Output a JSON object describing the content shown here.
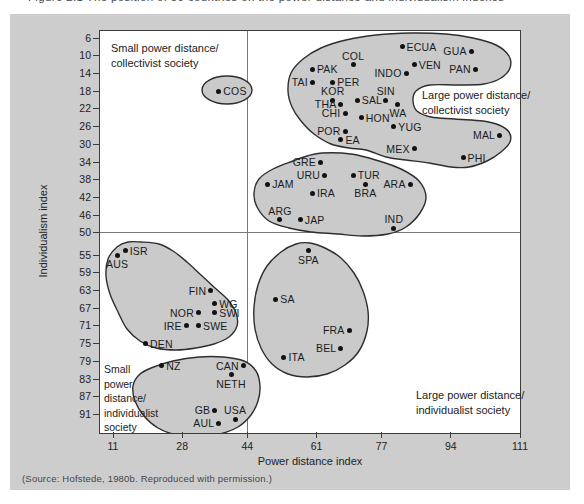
{
  "caption_clipped": "Figure 2.1  The position of 50 countries on the power distance and individualism indexes",
  "source_note": "(Source: Hofstede, 1980b. Reproduced with permission.)",
  "chart_data": {
    "type": "scatter",
    "xlabel": "Power distance index",
    "ylabel": "Individualism index",
    "x_ticks": [
      11,
      28,
      44,
      61,
      77,
      94,
      111
    ],
    "y_ticks": [
      6,
      10,
      14,
      18,
      22,
      26,
      30,
      34,
      38,
      42,
      46,
      50,
      55,
      59,
      63,
      67,
      71,
      75,
      79,
      83,
      87,
      91
    ],
    "x_range": [
      11,
      111
    ],
    "y_range": [
      6,
      91
    ],
    "y_inverted": true,
    "grid": false,
    "quadrant_divider": {
      "x": 44,
      "y": 50
    },
    "quadrant_labels": [
      {
        "id": "small-pd-collectivist",
        "lines": [
          "Small power distance/",
          "collectivist society"
        ],
        "x": 11,
        "y": 10,
        "size": "normal"
      },
      {
        "id": "large-pd-collectivist",
        "lines": [
          "Large power distance/",
          "collectivist society"
        ],
        "x": 322,
        "y": 57,
        "size": "normal"
      },
      {
        "id": "small-pd-individualist",
        "lines": [
          "Small",
          "power",
          "distance/",
          "individualist",
          "society"
        ],
        "x": 4,
        "y": 331,
        "size": "small"
      },
      {
        "id": "large-pd-individualist",
        "lines": [
          "Large power distance/",
          "individualist society"
        ],
        "x": 316,
        "y": 357,
        "size": "normal"
      }
    ],
    "points": [
      {
        "label": "PAK",
        "pdi": 60,
        "idv": 13,
        "lp": "right"
      },
      {
        "label": "COL",
        "pdi": 70,
        "idv": 12,
        "lp": "above"
      },
      {
        "label": "ECUA",
        "pdi": 82,
        "idv": 8,
        "lp": "right"
      },
      {
        "label": "GUA",
        "pdi": 99,
        "idv": 9,
        "lp": "left"
      },
      {
        "label": "VEN",
        "pdi": 85,
        "idv": 12,
        "lp": "right"
      },
      {
        "label": "PAN",
        "pdi": 100,
        "idv": 13,
        "lp": "left"
      },
      {
        "label": "INDO",
        "pdi": 83,
        "idv": 14,
        "lp": "left"
      },
      {
        "label": "TAI",
        "pdi": 60,
        "idv": 16,
        "lp": "left"
      },
      {
        "label": "PER",
        "pdi": 65,
        "idv": 16,
        "lp": "right"
      },
      {
        "label": "KOR",
        "pdi": 65,
        "idv": 20,
        "lp": "above"
      },
      {
        "label": "SIN",
        "pdi": 78,
        "idv": 20,
        "lp": "above"
      },
      {
        "label": "SAL",
        "pdi": 71,
        "idv": 20,
        "lp": "right"
      },
      {
        "label": "THA",
        "pdi": 67,
        "idv": 21,
        "lp": "left"
      },
      {
        "label": "WA",
        "pdi": 81,
        "idv": 21,
        "lp": "below"
      },
      {
        "label": "CHI",
        "pdi": 68,
        "idv": 23,
        "lp": "left"
      },
      {
        "label": "HON",
        "pdi": 72,
        "idv": 24,
        "lp": "right"
      },
      {
        "label": "POR",
        "pdi": 68,
        "idv": 27,
        "lp": "left"
      },
      {
        "label": "YUG",
        "pdi": 80,
        "idv": 26,
        "lp": "right"
      },
      {
        "label": "EA",
        "pdi": 67,
        "idv": 29,
        "lp": "right"
      },
      {
        "label": "MEX",
        "pdi": 85,
        "idv": 31,
        "lp": "left"
      },
      {
        "label": "MAL",
        "pdi": 106,
        "idv": 28,
        "lp": "left"
      },
      {
        "label": "PHI",
        "pdi": 97,
        "idv": 33,
        "lp": "right"
      },
      {
        "label": "COS",
        "pdi": 37,
        "idv": 18,
        "lp": "right"
      },
      {
        "label": "GRE",
        "pdi": 62,
        "idv": 34,
        "lp": "left"
      },
      {
        "label": "URU",
        "pdi": 63,
        "idv": 37,
        "lp": "left"
      },
      {
        "label": "TUR",
        "pdi": 70,
        "idv": 37,
        "lp": "right"
      },
      {
        "label": "JAM",
        "pdi": 49,
        "idv": 39,
        "lp": "right"
      },
      {
        "label": "IRA",
        "pdi": 60,
        "idv": 41,
        "lp": "right"
      },
      {
        "label": "BRA",
        "pdi": 73,
        "idv": 39,
        "lp": "below"
      },
      {
        "label": "ARA",
        "pdi": 84,
        "idv": 39,
        "lp": "left"
      },
      {
        "label": "ARG",
        "pdi": 52,
        "idv": 47,
        "lp": "above"
      },
      {
        "label": "JAP",
        "pdi": 57,
        "idv": 47,
        "lp": "right"
      },
      {
        "label": "IND",
        "pdi": 80,
        "idv": 49,
        "lp": "above"
      },
      {
        "label": "AUS",
        "pdi": 12,
        "idv": 55,
        "lp": "below"
      },
      {
        "label": "ISR",
        "pdi": 14,
        "idv": 54,
        "lp": "right"
      },
      {
        "label": "SPA",
        "pdi": 59,
        "idv": 54,
        "lp": "below"
      },
      {
        "label": "FIN",
        "pdi": 35,
        "idv": 63,
        "lp": "left"
      },
      {
        "label": "SA",
        "pdi": 51,
        "idv": 65,
        "lp": "right"
      },
      {
        "label": "WG",
        "pdi": 36,
        "idv": 66,
        "lp": "right"
      },
      {
        "label": "NOR",
        "pdi": 32,
        "idv": 68,
        "lp": "left"
      },
      {
        "label": "SWI",
        "pdi": 36,
        "idv": 68,
        "lp": "right"
      },
      {
        "label": "IRE",
        "pdi": 29,
        "idv": 71,
        "lp": "left"
      },
      {
        "label": "SWE",
        "pdi": 32,
        "idv": 71,
        "lp": "right"
      },
      {
        "label": "DEN",
        "pdi": 19,
        "idv": 75,
        "lp": "right"
      },
      {
        "label": "FRA",
        "pdi": 69,
        "idv": 72,
        "lp": "left"
      },
      {
        "label": "BEL",
        "pdi": 67,
        "idv": 76,
        "lp": "left"
      },
      {
        "label": "ITA",
        "pdi": 53,
        "idv": 78,
        "lp": "right"
      },
      {
        "label": "NZ",
        "pdi": 23,
        "idv": 80,
        "lp": "right"
      },
      {
        "label": "CAN",
        "pdi": 43,
        "idv": 80,
        "lp": "left"
      },
      {
        "label": "NETH",
        "pdi": 40,
        "idv": 82,
        "lp": "below"
      },
      {
        "label": "GB",
        "pdi": 36,
        "idv": 90,
        "lp": "left"
      },
      {
        "label": "USA",
        "pdi": 41,
        "idv": 92,
        "lp": "above"
      },
      {
        "label": "AUL",
        "pdi": 37,
        "idv": 93,
        "lp": "left"
      }
    ],
    "regions": [
      {
        "name": "large-pd-collectivist-region",
        "kind": "blob",
        "points": [
          [
            188,
            60
          ],
          [
            191,
            42
          ],
          [
            203,
            28
          ],
          [
            221,
            17
          ],
          [
            246,
            9
          ],
          [
            276,
            4
          ],
          [
            311,
            2
          ],
          [
            346,
            3
          ],
          [
            373,
            7
          ],
          [
            396,
            14
          ],
          [
            409,
            25
          ],
          [
            410,
            37
          ],
          [
            401,
            47
          ],
          [
            384,
            53
          ],
          [
            359,
            54
          ],
          [
            330,
            54
          ],
          [
            316,
            60
          ],
          [
            313,
            70
          ],
          [
            317,
            80
          ],
          [
            331,
            86
          ],
          [
            355,
            88
          ],
          [
            383,
            90
          ],
          [
            399,
            94
          ],
          [
            409,
            101
          ],
          [
            410,
            111
          ],
          [
            401,
            121
          ],
          [
            387,
            130
          ],
          [
            369,
            136
          ],
          [
            351,
            136
          ],
          [
            329,
            132
          ],
          [
            306,
            129
          ],
          [
            286,
            126
          ],
          [
            266,
            119
          ],
          [
            249,
            117
          ],
          [
            231,
            113
          ],
          [
            214,
            103
          ],
          [
            201,
            90
          ],
          [
            192,
            76
          ]
        ]
      },
      {
        "name": "costa-rica-region",
        "kind": "ellipse",
        "cx": 127,
        "cy": 59,
        "rx": 25,
        "ry": 14
      },
      {
        "name": "mid-collectivist-region",
        "kind": "blob",
        "points": [
          [
            222,
            122
          ],
          [
            251,
            123
          ],
          [
            279,
            130
          ],
          [
            301,
            138
          ],
          [
            319,
            150
          ],
          [
            326,
            166
          ],
          [
            320,
            182
          ],
          [
            306,
            196
          ],
          [
            288,
            203
          ],
          [
            262,
            205
          ],
          [
            238,
            203
          ],
          [
            211,
            201
          ],
          [
            189,
            197
          ],
          [
            169,
            190
          ],
          [
            157,
            176
          ],
          [
            154,
            162
          ],
          [
            159,
            148
          ],
          [
            173,
            138
          ],
          [
            193,
            130
          ],
          [
            207,
            125
          ]
        ]
      },
      {
        "name": "nordic-individualist-region",
        "kind": "blob",
        "points": [
          [
            41,
            211
          ],
          [
            59,
            213
          ],
          [
            73,
            220
          ],
          [
            87,
            231
          ],
          [
            101,
            244
          ],
          [
            115,
            257
          ],
          [
            128,
            269
          ],
          [
            136,
            282
          ],
          [
            137,
            295
          ],
          [
            129,
            306
          ],
          [
            114,
            313
          ],
          [
            96,
            317
          ],
          [
            76,
            319
          ],
          [
            56,
            317
          ],
          [
            40,
            310
          ],
          [
            27,
            298
          ],
          [
            18,
            281
          ],
          [
            10,
            263
          ],
          [
            6,
            245
          ],
          [
            8,
            228
          ],
          [
            17,
            216
          ],
          [
            28,
            211
          ]
        ]
      },
      {
        "name": "latin-european-region",
        "kind": "blob",
        "points": [
          [
            210,
            212
          ],
          [
            225,
            217
          ],
          [
            241,
            227
          ],
          [
            254,
            242
          ],
          [
            263,
            260
          ],
          [
            268,
            280
          ],
          [
            267,
            300
          ],
          [
            259,
            320
          ],
          [
            245,
            334
          ],
          [
            227,
            343
          ],
          [
            207,
            346
          ],
          [
            188,
            343
          ],
          [
            172,
            333
          ],
          [
            161,
            317
          ],
          [
            155,
            298
          ],
          [
            154,
            276
          ],
          [
            158,
            254
          ],
          [
            167,
            235
          ],
          [
            181,
            221
          ],
          [
            196,
            213
          ]
        ]
      },
      {
        "name": "anglo-individualist-region",
        "kind": "blob",
        "points": [
          [
            51,
            337
          ],
          [
            73,
            330
          ],
          [
            99,
            326
          ],
          [
            123,
            326
          ],
          [
            144,
            330
          ],
          [
            156,
            340
          ],
          [
            160,
            355
          ],
          [
            158,
            370
          ],
          [
            151,
            384
          ],
          [
            138,
            396
          ],
          [
            120,
            403
          ],
          [
            99,
            406
          ],
          [
            77,
            404
          ],
          [
            58,
            397
          ],
          [
            44,
            385
          ],
          [
            35,
            370
          ],
          [
            33,
            355
          ],
          [
            39,
            344
          ]
        ]
      }
    ],
    "colors": {
      "panel_bg": "#cdcdcd",
      "plot_bg": "#ffffff",
      "region_fill": "#cacaca",
      "region_stroke": "#2e2e2e",
      "axis": "#3c3c3c",
      "dot": "#121212"
    }
  }
}
